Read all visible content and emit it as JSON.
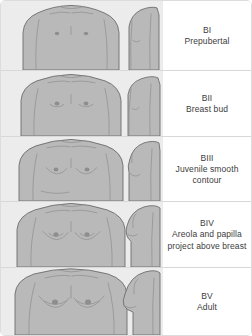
{
  "figure": {
    "background_color": "#ececec",
    "panel_color": "#ffffff",
    "body_fill_color": "#b9b9b9",
    "outline_color": "#6d6d6d",
    "text_color": "#3c3c3c",
    "divider_color": "#d8d8d8"
  },
  "stages": [
    {
      "code": "BI",
      "description": "Prepubertal",
      "views": [
        "frontal",
        "profile"
      ]
    },
    {
      "code": "BII",
      "description": "Breast bud",
      "views": [
        "frontal",
        "profile"
      ]
    },
    {
      "code": "BIII",
      "description": "Juvenile smooth contour",
      "views": [
        "frontal",
        "profile"
      ]
    },
    {
      "code": "BIV",
      "description": "Areola and papilla project above breast",
      "views": [
        "frontal",
        "profile"
      ]
    },
    {
      "code": "BV",
      "description": "Adult",
      "views": [
        "frontal",
        "profile"
      ]
    }
  ]
}
